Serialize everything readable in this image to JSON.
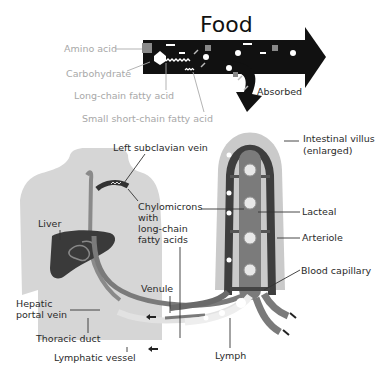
{
  "diagram": {
    "title": "Food",
    "absorbed_label": "Absorbed",
    "food_components": [
      {
        "label": "Amino acid"
      },
      {
        "label": "Carbohydrate"
      },
      {
        "label": "Long-chain fatty acid"
      },
      {
        "label": "Small short-chain fatty acid"
      }
    ],
    "body_labels": {
      "left_subclavian_vein": "Left subclavian vein",
      "chylomicrons_line1": "Chylomicrons",
      "chylomicrons_line2": "with",
      "chylomicrons_line3": "long-chain",
      "chylomicrons_line4": "fatty acids",
      "liver": "Liver",
      "hepatic_line1": "Hepatic",
      "hepatic_line2": "portal vein",
      "thoracic_duct": "Thoracic duct",
      "lymphatic_vessel": "Lymphatic vessel",
      "venule": "Venule",
      "lymph": "Lymph"
    },
    "villus_labels": {
      "villus_line1": "Intestinal villus",
      "villus_line2": "(enlarged)",
      "lacteal": "Lacteal",
      "arteriole": "Arteriole",
      "blood_capillary": "Blood capillary"
    },
    "colors": {
      "arrow": "#111111",
      "body": "#d4d4d4",
      "villus": "#c8c8c8",
      "vessel_dark": "#4a4a4a",
      "vessel_mid": "#7a7a7a",
      "lymph_light": "#e6e6e6",
      "liver": "#3c3c3c",
      "amino_square": "#8a8a8a"
    }
  }
}
